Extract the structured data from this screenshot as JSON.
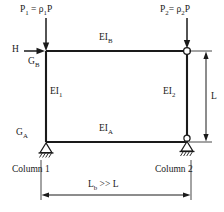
{
  "figure": {
    "type": "structural-frame-diagram",
    "colors": {
      "line": "#1a1a1a",
      "text": "#1a1a1a",
      "background": "#ffffff",
      "joint_fill": "#ffffff"
    },
    "frame": {
      "top_left": [
        46,
        51
      ],
      "top_right": [
        187,
        51
      ],
      "bottom_left": [
        46,
        142
      ],
      "bottom_right": [
        187,
        142
      ]
    },
    "loads": {
      "p1": "P₁ = ρ₁P",
      "p1_label_parts": {
        "name": "P",
        "name_sub": "1",
        "eq": " = ",
        "rho": "ρ",
        "rho_sub": "1",
        "p": "P"
      },
      "p2": "P₂= ρ₂P",
      "p2_label_parts": {
        "name": "P",
        "name_sub": "2",
        "eq": "= ",
        "rho": "ρ",
        "rho_sub": "2",
        "p": "P"
      },
      "horizontal": "H"
    },
    "members": {
      "top_beam": "EI",
      "top_beam_sub": "B",
      "bottom_beam": "EI",
      "bottom_beam_sub": "A",
      "left_column": "EI",
      "left_column_sub": "1",
      "right_column": "EI",
      "right_column_sub": "2"
    },
    "joints": {
      "upper": "G",
      "upper_sub": "B",
      "lower": "G",
      "lower_sub": "A"
    },
    "supports": {
      "left": "pinned-hatched",
      "right": "pinned-roller-hatched",
      "top_right": "hinge-circle"
    },
    "captions": {
      "column_1": "Column 1",
      "column_2": "Column 2"
    },
    "dimensions": {
      "vertical": "L",
      "horizontal": "L",
      "horizontal_sub": "b",
      "horizontal_rel": " >> L"
    }
  }
}
